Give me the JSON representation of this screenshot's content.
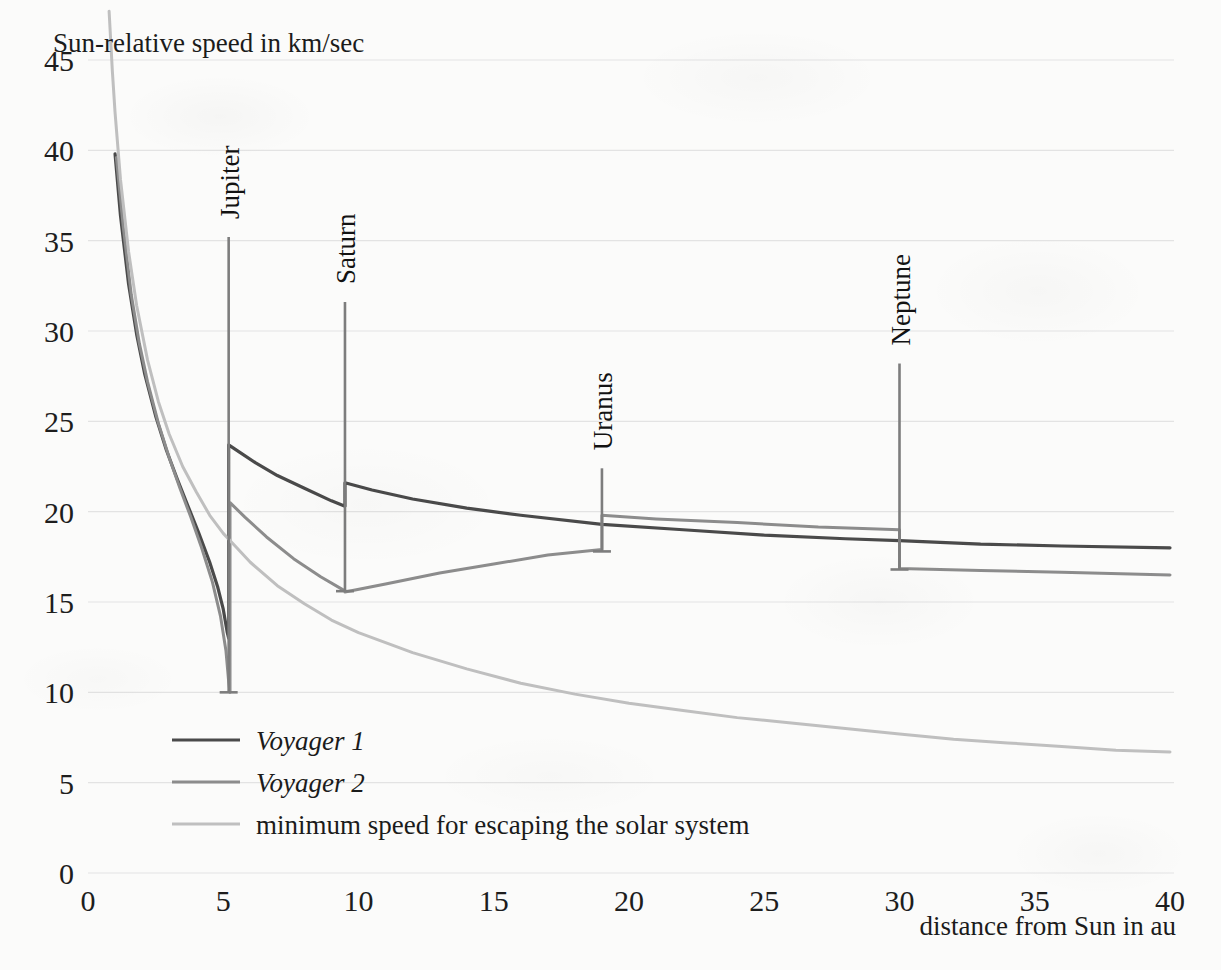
{
  "chart_data": {
    "type": "line",
    "title": "",
    "xlabel": "distance from Sun in au",
    "ylabel": "Sun-relative speed in km/sec",
    "xlim": [
      0,
      40
    ],
    "ylim": [
      0,
      45
    ],
    "xticks": [
      "0",
      "5",
      "10",
      "15",
      "20",
      "25",
      "30",
      "35",
      "40"
    ],
    "yticks": [
      "0",
      "5",
      "10",
      "15",
      "20",
      "25",
      "30",
      "35",
      "40",
      "45"
    ],
    "grid": "horizontal",
    "legend_position": "inside-lower-left",
    "series": [
      {
        "name": "Voyager 1",
        "color": "#4a4a4a",
        "style": "italic",
        "points": [
          [
            1.0,
            39.8
          ],
          [
            1.2,
            36.4
          ],
          [
            1.5,
            32.6
          ],
          [
            1.8,
            29.8
          ],
          [
            2.1,
            27.6
          ],
          [
            2.5,
            25.3
          ],
          [
            2.9,
            23.4
          ],
          [
            3.3,
            21.8
          ],
          [
            3.7,
            20.3
          ],
          [
            4.1,
            18.8
          ],
          [
            4.5,
            17.2
          ],
          [
            4.8,
            15.8
          ],
          [
            5.0,
            14.6
          ],
          [
            5.15,
            13.3
          ],
          [
            5.2,
            13.0
          ],
          [
            5.2,
            23.7
          ],
          [
            5.6,
            23.3
          ],
          [
            6.2,
            22.7
          ],
          [
            7.0,
            22.0
          ],
          [
            8.0,
            21.3
          ],
          [
            9.0,
            20.6
          ],
          [
            9.5,
            20.3
          ],
          [
            9.5,
            21.6
          ],
          [
            10.5,
            21.2
          ],
          [
            12.0,
            20.7
          ],
          [
            14.0,
            20.2
          ],
          [
            16.0,
            19.8
          ],
          [
            19.0,
            19.3
          ],
          [
            22.0,
            19.0
          ],
          [
            25.0,
            18.7
          ],
          [
            28.0,
            18.5
          ],
          [
            30.0,
            18.4
          ],
          [
            33.0,
            18.2
          ],
          [
            36.0,
            18.1
          ],
          [
            40.0,
            18.0
          ]
        ]
      },
      {
        "name": "Voyager 2",
        "color": "#8c8c8c",
        "style": "italic",
        "points": [
          [
            1.05,
            39.6
          ],
          [
            1.3,
            35.8
          ],
          [
            1.6,
            32.0
          ],
          [
            1.9,
            29.3
          ],
          [
            2.2,
            27.2
          ],
          [
            2.6,
            24.9
          ],
          [
            3.0,
            23.0
          ],
          [
            3.4,
            21.3
          ],
          [
            3.8,
            19.7
          ],
          [
            4.2,
            18.0
          ],
          [
            4.6,
            16.1
          ],
          [
            4.9,
            14.2
          ],
          [
            5.1,
            12.3
          ],
          [
            5.2,
            10.6
          ],
          [
            5.25,
            10.0
          ],
          [
            5.25,
            20.5
          ],
          [
            5.8,
            19.7
          ],
          [
            6.6,
            18.6
          ],
          [
            7.6,
            17.4
          ],
          [
            8.6,
            16.4
          ],
          [
            9.4,
            15.7
          ],
          [
            9.5,
            15.6
          ],
          [
            9.5,
            15.55
          ],
          [
            11.0,
            16.0
          ],
          [
            13.0,
            16.6
          ],
          [
            15.0,
            17.1
          ],
          [
            17.0,
            17.6
          ],
          [
            19.0,
            17.9
          ],
          [
            19.0,
            19.8
          ],
          [
            21.0,
            19.6
          ],
          [
            24.0,
            19.4
          ],
          [
            27.0,
            19.15
          ],
          [
            30.0,
            19.0
          ],
          [
            30.0,
            16.85
          ],
          [
            33.0,
            16.75
          ],
          [
            36.0,
            16.65
          ],
          [
            40.0,
            16.5
          ]
        ]
      },
      {
        "name": "minimum speed for escaping the solar system",
        "color": "#bfbfbf",
        "style": "normal",
        "points": [
          [
            0.78,
            47.7
          ],
          [
            0.9,
            44.4
          ],
          [
            1.0,
            42.1
          ],
          [
            1.2,
            38.4
          ],
          [
            1.5,
            34.4
          ],
          [
            1.8,
            31.4
          ],
          [
            2.2,
            28.4
          ],
          [
            2.6,
            26.1
          ],
          [
            3.0,
            24.3
          ],
          [
            3.5,
            22.5
          ],
          [
            4.0,
            21.1
          ],
          [
            4.5,
            19.8
          ],
          [
            5.0,
            18.8
          ],
          [
            5.5,
            18.0
          ],
          [
            6.0,
            17.2
          ],
          [
            7.0,
            15.9
          ],
          [
            8.0,
            14.9
          ],
          [
            9.0,
            14.0
          ],
          [
            10.0,
            13.3
          ],
          [
            12.0,
            12.2
          ],
          [
            14.0,
            11.3
          ],
          [
            16.0,
            10.5
          ],
          [
            18.0,
            9.9
          ],
          [
            20.0,
            9.4
          ],
          [
            22.0,
            9.0
          ],
          [
            24.0,
            8.6
          ],
          [
            26.0,
            8.3
          ],
          [
            28.0,
            8.0
          ],
          [
            30.0,
            7.7
          ],
          [
            32.0,
            7.4
          ],
          [
            34.0,
            7.2
          ],
          [
            36.0,
            7.0
          ],
          [
            38.0,
            6.8
          ],
          [
            40.0,
            6.7
          ]
        ]
      }
    ],
    "planet_markers": [
      {
        "name": "Jupiter",
        "au": 5.2,
        "line_top": 35.2,
        "line_bottom": 10.0,
        "label_baseline_value": 36.2
      },
      {
        "name": "Saturn",
        "au": 9.5,
        "line_top": 31.6,
        "line_bottom": 15.6,
        "label_baseline_value": 32.6
      },
      {
        "name": "Uranus",
        "au": 19.0,
        "line_top": 22.4,
        "line_bottom": 17.8,
        "label_baseline_value": 23.4
      },
      {
        "name": "Neptune",
        "au": 30.0,
        "line_top": 28.2,
        "line_bottom": 16.8,
        "label_baseline_value": 29.2
      }
    ]
  },
  "legend": {
    "entries": [
      {
        "label": "Voyager 1",
        "color": "#4a4a4a",
        "italic": true
      },
      {
        "label": "Voyager 2",
        "color": "#8c8c8c",
        "italic": true
      },
      {
        "label": "minimum speed for escaping the solar system",
        "color": "#bfbfbf",
        "italic": false
      }
    ]
  }
}
